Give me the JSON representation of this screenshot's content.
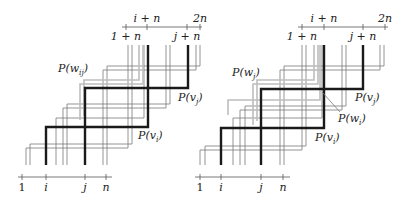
{
  "figure": {
    "panels": [
      {
        "id": "left",
        "bottom_axis": {
          "y": 177,
          "x_start": 18,
          "x_end": 112,
          "ticks": [
            {
              "x": 22,
              "label": "1"
            },
            {
              "x": 46,
              "label": "i"
            },
            {
              "x": 85,
              "label": "j"
            },
            {
              "x": 106,
              "label": "n"
            }
          ]
        },
        "top_axis": {
          "y": 27,
          "x_start": 122,
          "x_end": 202,
          "ticks": [
            {
              "x": 126,
              "label": "1 + n",
              "pos": "below"
            },
            {
              "x": 147,
              "label": "i + n",
              "pos": "above"
            },
            {
              "x": 187,
              "label": "j + n",
              "pos": "below"
            },
            {
              "x": 200,
              "label": "2n",
              "pos": "above"
            }
          ]
        },
        "thin_paths": [
          [
            [
              26,
              165
            ],
            [
              26,
              148
            ],
            [
              128,
              148
            ],
            [
              128,
              45
            ]
          ],
          [
            [
              30,
              165
            ],
            [
              30,
              144
            ],
            [
              132,
              144
            ],
            [
              132,
              45
            ]
          ],
          [
            [
              63,
              165
            ],
            [
              63,
              108
            ],
            [
              166,
              108
            ],
            [
              166,
              45
            ]
          ],
          [
            [
              67,
              165
            ],
            [
              67,
              104
            ],
            [
              170,
              104
            ],
            [
              170,
              45
            ]
          ],
          [
            [
              103,
              165
            ],
            [
              103,
              70
            ],
            [
              196,
              70
            ],
            [
              196,
              45
            ]
          ],
          [
            [
              107,
              165
            ],
            [
              107,
              66
            ],
            [
              200,
              66
            ],
            [
              200,
              45
            ]
          ],
          [
            [
              56,
              165
            ],
            [
              56,
              118
            ],
            [
              144,
              118
            ],
            [
              144,
              45
            ]
          ]
        ],
        "gray_paths": [
          [
            [
              80,
              120
            ],
            [
              80,
              84
            ],
            [
              143,
              84
            ],
            [
              143,
              45
            ]
          ],
          [
            [
              84,
              116
            ],
            [
              84,
              80
            ],
            [
              139,
              80
            ],
            [
              139,
              45
            ]
          ]
        ],
        "thick_paths": [
          {
            "name": "P(v_i)",
            "points": [
              [
                46,
                165
              ],
              [
                46,
                127
              ],
              [
                148,
                127
              ],
              [
                148,
                45
              ]
            ]
          },
          {
            "name": "P(v_j)",
            "points": [
              [
                85,
                165
              ],
              [
                85,
                88
              ],
              [
                188,
                88
              ],
              [
                188,
                45
              ]
            ]
          }
        ],
        "labels": [
          {
            "text": "P(w",
            "sub": "ij",
            "x": 58,
            "y": 72,
            "name": "label-p-w-ij"
          },
          {
            "text": "P(v",
            "sub": "j",
            "x": 178,
            "y": 101,
            "name": "label-p-v-j"
          },
          {
            "text": "P(v",
            "sub": "i",
            "x": 138,
            "y": 139,
            "name": "label-p-v-i"
          }
        ]
      },
      {
        "id": "right",
        "bottom_axis": {
          "y": 177,
          "x_start": 195,
          "x_end": 290,
          "ticks": [
            {
              "x": 200,
              "label": "1"
            },
            {
              "x": 221,
              "label": "i"
            },
            {
              "x": 261,
              "label": "j"
            },
            {
              "x": 283,
              "label": "n"
            }
          ]
        },
        "top_axis": {
          "y": 27,
          "x_start": 298,
          "x_end": 388,
          "ticks": [
            {
              "x": 302,
              "label": "1 + n",
              "pos": "below"
            },
            {
              "x": 324,
              "label": "i + n",
              "pos": "above"
            },
            {
              "x": 363,
              "label": "j + n",
              "pos": "below"
            },
            {
              "x": 385,
              "label": "2n",
              "pos": "above"
            }
          ]
        },
        "thin_paths": [
          [
            [
              200,
              165
            ],
            [
              200,
              150
            ],
            [
              302,
              150
            ],
            [
              302,
              45
            ]
          ],
          [
            [
              205,
              165
            ],
            [
              205,
              146
            ],
            [
              306,
              146
            ],
            [
              306,
              45
            ]
          ],
          [
            [
              240,
              165
            ],
            [
              240,
              110
            ],
            [
              342,
              110
            ],
            [
              342,
              45
            ]
          ],
          [
            [
              245,
              165
            ],
            [
              245,
              106
            ],
            [
              346,
              106
            ],
            [
              346,
              45
            ]
          ],
          [
            [
              280,
              165
            ],
            [
              280,
              70
            ],
            [
              380,
              70
            ],
            [
              380,
              45
            ]
          ],
          [
            [
              284,
              165
            ],
            [
              284,
              66
            ],
            [
              384,
              66
            ],
            [
              384,
              45
            ]
          ],
          [
            [
              233,
              165
            ],
            [
              233,
              118
            ],
            [
              322,
              118
            ],
            [
              322,
              45
            ]
          ]
        ],
        "gray_paths": [
          [
            [
              253,
              125
            ],
            [
              253,
              84
            ],
            [
              318,
              84
            ],
            [
              318,
              45
            ]
          ],
          [
            [
              257,
              121
            ],
            [
              257,
              80
            ],
            [
              314,
              80
            ],
            [
              314,
              45
            ]
          ],
          [
            [
              228,
              115
            ],
            [
              228,
              100
            ],
            [
              320,
              100
            ],
            [
              320,
              45
            ]
          ]
        ],
        "thick_paths": [
          {
            "name": "P(v_i)",
            "points": [
              [
                221,
                165
              ],
              [
                221,
                128
              ],
              [
                324,
                128
              ],
              [
                324,
                45
              ]
            ]
          },
          {
            "name": "P(v_j)",
            "points": [
              [
                261,
                165
              ],
              [
                261,
                89
              ],
              [
                363,
                89
              ],
              [
                363,
                45
              ]
            ]
          }
        ],
        "leader_line": [
          [
            322,
            92
          ],
          [
            340,
            112
          ]
        ],
        "labels": [
          {
            "text": "P(w",
            "sub": "j",
            "x": 232,
            "y": 76,
            "name": "label-p-w-j"
          },
          {
            "text": "P(v",
            "sub": "j",
            "x": 355,
            "y": 101,
            "name": "label-p-v-j"
          },
          {
            "text": "P(w",
            "sub": "i",
            "x": 338,
            "y": 122,
            "name": "label-p-w-i"
          },
          {
            "text": "P(v",
            "sub": "i",
            "x": 315,
            "y": 141,
            "name": "label-p-v-i"
          }
        ]
      }
    ],
    "colors": {
      "thin": "#7a7a7a",
      "gray": "#bdbdbd",
      "thick": "#1a1a1a",
      "axis": "#555555"
    }
  }
}
